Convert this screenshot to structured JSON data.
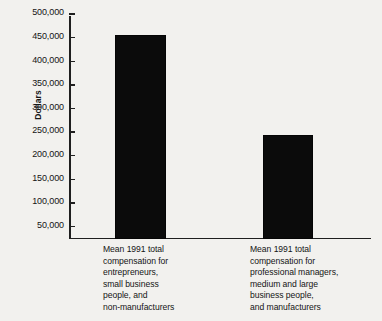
{
  "chart_data": {
    "type": "bar",
    "title": "",
    "subtitle": "",
    "xlabel": "",
    "ylabel": "Dollars",
    "ylim": [
      27000,
      500000
    ],
    "grid": false,
    "legend": false,
    "bar_color": "#0b0b0b",
    "background_color": "#f2f1ee",
    "categories": [
      "Mean 1991 total\ncompensation for\nentrepreneurs,\nsmall business\npeople, and\nnon-manufacturers",
      "Mean 1991 total\ncompensation for\nprofessional managers,\nmedium and large\nbusiness people,\nand manufacturers"
    ],
    "values": [
      458000,
      248000
    ],
    "yticks": [
      50000,
      100000,
      150000,
      200000,
      250000,
      300000,
      350000,
      400000,
      450000,
      500000
    ],
    "ytick_labels": [
      "50,000",
      "100,000",
      "150,000",
      "200,000",
      "250,000",
      "300,000",
      "350,000",
      "400,000",
      "450,000",
      "500,000"
    ]
  }
}
